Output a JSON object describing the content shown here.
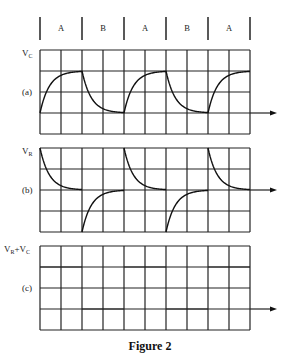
{
  "phases": [
    "A",
    "B",
    "A",
    "B",
    "A"
  ],
  "panels": [
    {
      "id": "a",
      "ylabel_main": "V",
      "ylabel_sub": "C",
      "tag": "(a)",
      "signal": "capacitor_voltage"
    },
    {
      "id": "b",
      "ylabel_main": "V",
      "ylabel_sub": "R",
      "tag": "(b)",
      "signal": "resistor_voltage"
    },
    {
      "id": "c",
      "ylabel_main": "V",
      "ylabel_sub": "R",
      "ylabel_plus": "+V",
      "ylabel_sub2": "C",
      "tag": "(c)",
      "signal": "sum"
    }
  ],
  "caption": "Figure 2",
  "chart_data": {
    "type": "line",
    "title": "Figure 2",
    "x_divisions": 10,
    "y_divisions": 4,
    "phase_labels": [
      "A",
      "B",
      "A",
      "B",
      "A"
    ],
    "series": [
      {
        "name": "V_C (a)",
        "description": "exponential charge during A to +2 div, discharge during B to 0",
        "baseline_div": 1,
        "high_div": 3
      },
      {
        "name": "V_R (b)",
        "description": "spike +2 div decaying to 0 during A; spike -2 div decaying to 0 during B",
        "baseline_div": 2,
        "amplitude_div": 2
      },
      {
        "name": "V_R+V_C (c)",
        "description": "square wave: +2 div during A, 0 during B",
        "baseline_div": 1,
        "high_div": 3
      }
    ]
  }
}
